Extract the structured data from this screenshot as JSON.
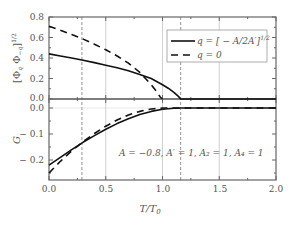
{
  "chart_data": [
    {
      "type": "line",
      "panel": "top",
      "title": "",
      "xlabel": "T/T_0",
      "ylabel": "[Φ_q Φ_{-q}]^{1/2}",
      "xlim": [
        0.0,
        2.0
      ],
      "ylim": [
        0.0,
        0.8
      ],
      "yticks": [
        "0.0",
        "0.2",
        "0.4",
        "0.6",
        "0.8"
      ],
      "grid": false,
      "legend_position": "upper right",
      "series": [
        {
          "name": "q = [−A/2A′]^{1/2}",
          "style": "solid",
          "x": [
            0.0,
            0.1,
            0.2,
            0.29,
            0.4,
            0.5,
            0.6,
            0.7,
            0.8,
            0.9,
            1.0,
            1.05,
            1.1,
            1.14,
            1.16,
            2.0
          ],
          "y": [
            0.44,
            0.42,
            0.4,
            0.38,
            0.355,
            0.33,
            0.305,
            0.275,
            0.24,
            0.2,
            0.14,
            0.105,
            0.065,
            0.025,
            0.0,
            0.0
          ]
        },
        {
          "name": "q = 0",
          "style": "dashed",
          "x": [
            0.0,
            0.1,
            0.2,
            0.29,
            0.4,
            0.5,
            0.6,
            0.7,
            0.8,
            0.85,
            0.9,
            0.95,
            0.98,
            1.0
          ],
          "y": [
            0.71,
            0.67,
            0.63,
            0.59,
            0.535,
            0.48,
            0.42,
            0.35,
            0.26,
            0.2,
            0.14,
            0.07,
            0.02,
            0.0
          ]
        }
      ]
    },
    {
      "type": "line",
      "panel": "bottom",
      "title": "",
      "xlabel": "T/T_0",
      "ylabel": "G",
      "xlim": [
        0.0,
        2.0
      ],
      "ylim": [
        -0.277,
        0.0
      ],
      "xticks": [
        "0.0",
        "0.5",
        "1.0",
        "1.5",
        "2.0"
      ],
      "yticks": [
        "0.0",
        "−0.1",
        "−0.2"
      ],
      "grid": false,
      "annotation": "A = −0.8, A′ = 1, A₂ = 1, A₄ = 1",
      "series": [
        {
          "name": "q = [−A/2A′]^{1/2}",
          "style": "solid",
          "x": [
            0.0,
            0.1,
            0.2,
            0.3,
            0.4,
            0.5,
            0.6,
            0.7,
            0.8,
            0.9,
            1.0,
            1.1,
            1.16,
            2.0
          ],
          "y": [
            -0.22,
            -0.19,
            -0.16,
            -0.132,
            -0.106,
            -0.082,
            -0.06,
            -0.041,
            -0.025,
            -0.013,
            -0.005,
            -0.001,
            0.0,
            0.0
          ]
        },
        {
          "name": "q = 0",
          "style": "dashed",
          "x": [
            0.0,
            0.1,
            0.2,
            0.3,
            0.4,
            0.5,
            0.6,
            0.7,
            0.8,
            0.9,
            1.0,
            2.0
          ],
          "y": [
            -0.25,
            -0.205,
            -0.165,
            -0.13,
            -0.098,
            -0.07,
            -0.046,
            -0.027,
            -0.013,
            -0.004,
            0.0,
            0.0
          ]
        }
      ]
    }
  ],
  "reference_lines": {
    "dashed_vertical_x": [
      0.29,
      1.16
    ],
    "solid_gray_vertical_x": [
      0.5,
      1.0,
      1.5
    ]
  },
  "labels": {
    "top_ylabel_main": "[Φ",
    "top_ylabel_sub1": "q",
    "top_ylabel_mid": " Φ",
    "top_ylabel_sub2": "−q",
    "top_ylabel_end": "]",
    "top_ylabel_sup": "1/2",
    "bottom_ylabel": "G",
    "xlabel_main": "T/T",
    "xlabel_sub": "0",
    "legend_solid": "q = [ − A/2A′]",
    "legend_solid_sup": "1/2",
    "legend_dashed": "q = 0",
    "annotation": "A = −0.8,  A′ = 1,  A₂ = 1,  A₄ = 1",
    "top_yticks": [
      "0.8",
      "0.6",
      "0.4",
      "0.2",
      "0.0"
    ],
    "bottom_yticks": [
      "0.0",
      "− 0.1",
      "− 0.2"
    ],
    "xticks": [
      "0.0",
      "0.5",
      "1.0",
      "1.5",
      "2.0"
    ]
  },
  "colors": {
    "axis": "#666666",
    "curve": "#111111",
    "grid_gray": "#bbbbbb",
    "ref_dashed": "#777777",
    "legend_border": "#999999"
  }
}
